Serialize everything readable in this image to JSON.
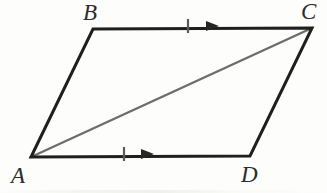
{
  "figure": {
    "type": "geometry-diagram",
    "shape": "parallelogram",
    "background_color": "#fdfdfb",
    "outline_color": "#1f1f1f",
    "diagonal_color": "#6d6d6d",
    "tick_color": "#5a5a5a",
    "outline_width": 3,
    "diagonal_width": 2.4,
    "vertices": [
      {
        "name": "A",
        "label": "A",
        "x": 31,
        "y": 157,
        "label_x": 11,
        "label_y": 164
      },
      {
        "name": "B",
        "label": "B",
        "x": 93,
        "y": 29,
        "label_x": 83,
        "label_y": 1
      },
      {
        "name": "C",
        "label": "C",
        "x": 312,
        "y": 28,
        "label_x": 301,
        "label_y": 0
      },
      {
        "name": "D",
        "label": "D",
        "x": 250,
        "y": 156,
        "label_x": 241,
        "label_y": 163
      }
    ],
    "sides": [
      {
        "name": "AB",
        "from": "A",
        "to": "B",
        "style": "solid-dark"
      },
      {
        "name": "BC",
        "from": "B",
        "to": "C",
        "style": "solid-dark",
        "marks": [
          "single-tick",
          "arrow-right"
        ]
      },
      {
        "name": "CD",
        "from": "C",
        "to": "D",
        "style": "solid-dark"
      },
      {
        "name": "AD",
        "from": "A",
        "to": "D",
        "style": "solid-dark",
        "marks": [
          "single-tick",
          "arrow-right"
        ]
      }
    ],
    "diagonal": {
      "name": "AC",
      "from": "A",
      "to": "C",
      "style": "solid-gray"
    },
    "marks": [
      {
        "name": "tick-top",
        "type": "single-tick",
        "x": 188,
        "y": 26,
        "half_height": 7
      },
      {
        "name": "arrow-top",
        "type": "arrow-right",
        "x": 206,
        "y": 26,
        "length": 13,
        "half_width": 5
      },
      {
        "name": "tick-bottom",
        "type": "single-tick",
        "x": 124,
        "y": 154,
        "half_height": 7
      },
      {
        "name": "arrow-bottom",
        "type": "arrow-right",
        "x": 141,
        "y": 154,
        "length": 13,
        "half_width": 5
      }
    ]
  }
}
